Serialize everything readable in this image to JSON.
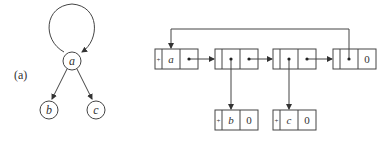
{
  "figure_label": "(a)",
  "graph": {
    "nodes": [
      {
        "id": "a",
        "label": "a"
      },
      {
        "id": "b",
        "label": "b"
      },
      {
        "id": "c",
        "label": "c"
      }
    ],
    "edges": [
      {
        "from": "a",
        "to": "a",
        "type": "self-loop"
      },
      {
        "from": "a",
        "to": "b"
      },
      {
        "from": "a",
        "to": "c"
      }
    ]
  },
  "list": {
    "top_cells": [
      {
        "tag": "+",
        "left": "a",
        "right": "•"
      },
      {
        "tag": "-",
        "left": "•",
        "right": "•"
      },
      {
        "tag": "-",
        "left": "•",
        "right": "•"
      },
      {
        "tag": "-",
        "left": "•",
        "right": "0"
      }
    ],
    "bottom_cells": [
      {
        "tag": "+",
        "left": "b",
        "right": "0"
      },
      {
        "tag": "+",
        "left": "c",
        "right": "0"
      }
    ]
  },
  "colors": {
    "stroke": "#444444",
    "text": "#333333"
  }
}
